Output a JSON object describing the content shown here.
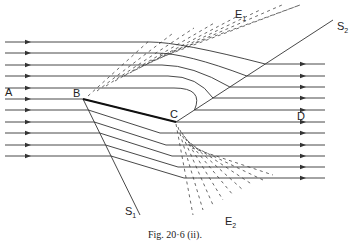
{
  "figure": {
    "caption": "Fig. 20·6 (ii)."
  },
  "labels": {
    "A": "A",
    "B": "B",
    "C": "C",
    "D": "D",
    "E1": {
      "main": "E",
      "sub": "1"
    },
    "E2": {
      "main": "E",
      "sub": "2"
    },
    "S1": {
      "main": "S",
      "sub": "1"
    },
    "S2": {
      "main": "S",
      "sub": "2"
    }
  },
  "counts": {
    "incident_rays": 11,
    "exit_rays": 11,
    "wavefronts_E1": 9,
    "wavefronts_E2": 9
  }
}
